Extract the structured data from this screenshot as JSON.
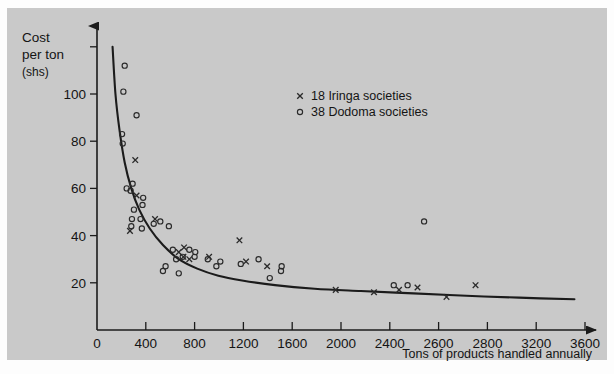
{
  "chart_data": {
    "type": "scatter",
    "title": "",
    "xlabel": "Tons of products handled annually",
    "ylabel": "Cost per ton (shs)",
    "ylabel_lines": [
      "Cost",
      "per ton",
      "(shs)"
    ],
    "xlim": [
      0,
      3700
    ],
    "ylim": [
      0,
      125
    ],
    "grid": false,
    "xticks": [
      0,
      400,
      800,
      1200,
      1600,
      2000,
      2400,
      2600,
      2800,
      3200,
      3600
    ],
    "xticklabels": [
      "0",
      "400",
      "800",
      "1200",
      "1600",
      "2000",
      "2400",
      "2600",
      "2800",
      "3200",
      "3600"
    ],
    "yticks": [
      20,
      40,
      60,
      80,
      100,
      120
    ],
    "yticklabels": [
      "20",
      "40",
      "60",
      "80",
      "100",
      ""
    ],
    "legend_position": "upper-center-right",
    "legend": [
      {
        "marker": "x",
        "count": "18",
        "name": "Iringa societies",
        "label": "18 Iringa societies"
      },
      {
        "marker": "o",
        "count": "38",
        "name": "Dodoma societies",
        "label": "38 Dodoma societies"
      }
    ],
    "series": [
      {
        "name": "Dodoma societies",
        "marker": "o",
        "count": 38,
        "points": [
          [
            210,
            112
          ],
          [
            200,
            101
          ],
          [
            300,
            91
          ],
          [
            190,
            83
          ],
          [
            195,
            79
          ],
          [
            270,
            62
          ],
          [
            255,
            59
          ],
          [
            345,
            53
          ],
          [
            280,
            51
          ],
          [
            265,
            47
          ],
          [
            330,
            47
          ],
          [
            260,
            44
          ],
          [
            340,
            43
          ],
          [
            480,
            46
          ],
          [
            545,
            44
          ],
          [
            430,
            45
          ],
          [
            520,
            27
          ],
          [
            500,
            25
          ],
          [
            620,
            24
          ],
          [
            700,
            34
          ],
          [
            745,
            33
          ],
          [
            650,
            31
          ],
          [
            740,
            31
          ],
          [
            840,
            30
          ],
          [
            905,
            27
          ],
          [
            1090,
            28
          ],
          [
            1225,
            30
          ],
          [
            1310,
            22
          ],
          [
            1395,
            25
          ],
          [
            1400,
            27
          ],
          [
            2250,
            19
          ],
          [
            2355,
            19
          ],
          [
            2480,
            46
          ],
          [
            935,
            29
          ],
          [
            600,
            30
          ],
          [
            575,
            34
          ],
          [
            350,
            56
          ],
          [
            225,
            60
          ]
        ]
      },
      {
        "name": "Iringa societies",
        "marker": "x",
        "count": 18,
        "points": [
          [
            290,
            72
          ],
          [
            300,
            57
          ],
          [
            250,
            42
          ],
          [
            620,
            33
          ],
          [
            660,
            35
          ],
          [
            655,
            31
          ],
          [
            850,
            31
          ],
          [
            1080,
            38
          ],
          [
            1130,
            29
          ],
          [
            1290,
            27
          ],
          [
            1810,
            17
          ],
          [
            2100,
            16
          ],
          [
            2290,
            17
          ],
          [
            2430,
            18
          ],
          [
            2650,
            14
          ],
          [
            2870,
            19
          ],
          [
            440,
            47
          ],
          [
            700,
            30
          ]
        ]
      }
    ],
    "fitted_curve": {
      "description": "decreasing hyperbolic cost curve",
      "points": [
        [
          118,
          120
        ],
        [
          140,
          100
        ],
        [
          170,
          85
        ],
        [
          210,
          71
        ],
        [
          260,
          60
        ],
        [
          320,
          51
        ],
        [
          400,
          43
        ],
        [
          500,
          36
        ],
        [
          620,
          30
        ],
        [
          760,
          26
        ],
        [
          920,
          23
        ],
        [
          1100,
          21
        ],
        [
          1350,
          19
        ],
        [
          1650,
          17.5
        ],
        [
          2000,
          16.5
        ],
        [
          2400,
          15.5
        ],
        [
          2800,
          14.5
        ],
        [
          3200,
          13.7
        ],
        [
          3620,
          13
        ]
      ]
    }
  }
}
